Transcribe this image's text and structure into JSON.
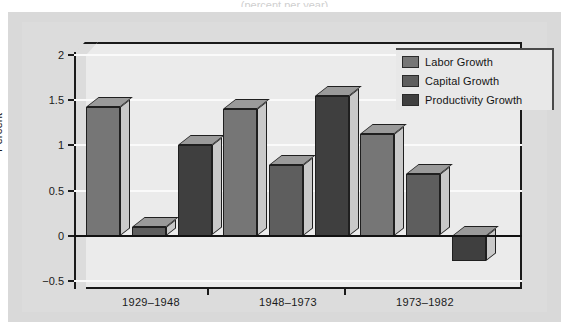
{
  "figure": {
    "top_caption": "(percent per year)",
    "background_color": "#ffffff",
    "panel_color": "#d9d9d9",
    "plot_background_color": "#ebebeb"
  },
  "chart_data": {
    "type": "bar",
    "title": "",
    "subtitle": "",
    "xlabel": "",
    "ylabel": "Percent",
    "categories": [
      "1929–1948",
      "1948–1973",
      "1973–1982"
    ],
    "series": [
      {
        "name": "Labor Growth",
        "values": [
          1.43,
          1.4,
          1.13
        ],
        "color": "#767676"
      },
      {
        "name": "Capital Growth",
        "values": [
          0.1,
          0.78,
          0.68
        ],
        "color": "#5e5e5e"
      },
      {
        "name": "Productivity Growth",
        "values": [
          1.0,
          1.55,
          -0.28
        ],
        "color": "#3f3f3f"
      }
    ],
    "ylim": [
      -0.5,
      2
    ],
    "yticks": [
      "2",
      "1.5",
      "1",
      "0.5",
      "0",
      "−0.5"
    ],
    "ytick_values": [
      2,
      1.5,
      1,
      0.5,
      0,
      -0.5
    ],
    "grid": true,
    "grid_color": "#fafafa",
    "zero_line": 0,
    "legend_position": "top-right",
    "style": "3d-bar"
  },
  "legend": {
    "entries": [
      {
        "label": "Labor Growth",
        "color": "#767676"
      },
      {
        "label": "Capital Growth",
        "color": "#5e5e5e"
      },
      {
        "label": "Productivity Growth",
        "color": "#3f3f3f"
      }
    ]
  }
}
